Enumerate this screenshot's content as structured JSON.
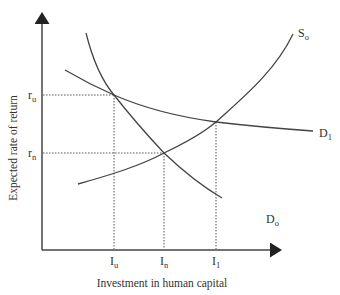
{
  "axes": {
    "y_label": "Expected rate of return",
    "x_label": "Investment in human capital"
  },
  "y_ticks": [
    {
      "main": "r",
      "sub": "u"
    },
    {
      "main": "r",
      "sub": "n"
    }
  ],
  "x_ticks": [
    {
      "main": "I",
      "sub": "u"
    },
    {
      "main": "I",
      "sub": "n"
    },
    {
      "main": "I",
      "sub": "1"
    }
  ],
  "curves": {
    "supply": {
      "main": "S",
      "sub": "o"
    },
    "demand_0": {
      "main": "D",
      "sub": "o"
    },
    "demand_1": {
      "main": "D",
      "sub": "1"
    }
  },
  "colors": {
    "line": "#444444",
    "text": "#333333",
    "background": "#ffffff"
  }
}
